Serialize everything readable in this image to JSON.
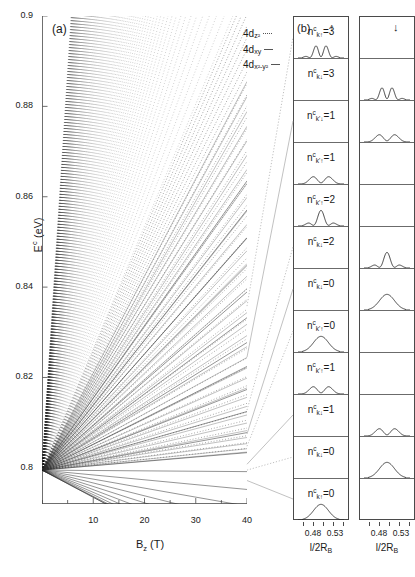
{
  "figure": {
    "panel_a_letter": "(a)",
    "panel_b_letter": "(b)"
  },
  "panel_a": {
    "ylabel_main": "E",
    "ylabel_sup": "c",
    "ylabel_unit": " (eV)",
    "xlabel_main": "B",
    "xlabel_sub": "z",
    "xlabel_unit": " (T)",
    "yticks": [
      "0.9",
      "0.88",
      "0.86",
      "0.84",
      "0.82",
      "0.8"
    ],
    "ytick_values": [
      0.9,
      0.88,
      0.86,
      0.84,
      0.82,
      0.8
    ],
    "xticks": [
      "10",
      "20",
      "30",
      "40"
    ],
    "xtick_values": [
      10,
      20,
      30,
      40
    ],
    "ylim": [
      0.792,
      0.9
    ],
    "xlim": [
      0,
      40
    ],
    "legend": [
      {
        "label_main": "4d",
        "label_sub": "z2",
        "sub_display": "z²"
      },
      {
        "label_main": "4d",
        "label_sub": "xy",
        "sub_display": "xy"
      },
      {
        "label_main": "4d",
        "label_sub": "x2-y2",
        "sub_display": "x²-y²"
      }
    ]
  },
  "chart_data": {
    "type": "line",
    "title": "",
    "xlabel": "B_z (T)",
    "ylabel": "E^c (eV)",
    "xlim": [
      0,
      40
    ],
    "ylim": [
      0.792,
      0.9
    ],
    "grid": false,
    "origin_energy": 0.7995,
    "series": [
      {
        "name": "4d_z2",
        "style": "dotted",
        "slope_count": 46,
        "slope_max": 0.00265,
        "slope_min": 0.00012
      },
      {
        "name": "4d_xy",
        "style": "solid-thin",
        "slope_count": 34,
        "slope_max": 0.00215,
        "slope_min": 0.0001
      },
      {
        "name": "4d_x2-y2",
        "style": "solid",
        "slope_count": 22,
        "slope_max": 0.0016,
        "slope_min": -0.0006
      }
    ]
  },
  "panel_b": {
    "header_up": "↑",
    "header_down": "↓",
    "xticks": [
      "0.48",
      "0.53"
    ],
    "xtick_values": [
      0.48,
      0.53
    ],
    "xlabel_main": "l/2R",
    "xlabel_sub": "B",
    "rows": [
      {
        "n_value": "3",
        "k_symbol": "k",
        "spin": "↑",
        "label": "n",
        "column": "up",
        "peaks": 4
      },
      {
        "n_value": "3",
        "k_symbol": "k",
        "spin": "↓",
        "label": "n",
        "column": "down",
        "peaks": 4
      },
      {
        "n_value": "1",
        "k_symbol": "k'",
        "spin": "↓",
        "label": "n",
        "column": "down",
        "peaks": 2
      },
      {
        "n_value": "1",
        "k_symbol": "k'",
        "spin": "↑",
        "label": "n",
        "column": "up",
        "peaks": 2
      },
      {
        "n_value": "2",
        "k_symbol": "k'",
        "spin": "↑",
        "label": "n",
        "column": "up",
        "peaks": 3
      },
      {
        "n_value": "2",
        "k_symbol": "k",
        "spin": "↓",
        "label": "n",
        "column": "down",
        "peaks": 3
      },
      {
        "n_value": "0",
        "k_symbol": "k",
        "spin": "↓",
        "label": "n",
        "column": "down",
        "peaks": 1
      },
      {
        "n_value": "0",
        "k_symbol": "k'",
        "spin": "↑",
        "label": "n",
        "column": "up",
        "peaks": 1
      },
      {
        "n_value": "1",
        "k_symbol": "k'",
        "spin": "↑",
        "label": "n",
        "column": "up",
        "peaks": 2
      },
      {
        "n_value": "1",
        "k_symbol": "k",
        "spin": "↓",
        "label": "n",
        "column": "down",
        "peaks": 2
      },
      {
        "n_value": "0",
        "k_symbol": "k",
        "spin": "↓",
        "label": "n",
        "column": "down",
        "peaks": 1
      },
      {
        "n_value": "0",
        "k_symbol": "k",
        "spin": "↑",
        "label": "n",
        "column": "up",
        "peaks": 1
      }
    ]
  },
  "colors": {
    "axis": "#4a4a4a",
    "line": "#2b2b2b",
    "text": "#1a1a1a"
  }
}
